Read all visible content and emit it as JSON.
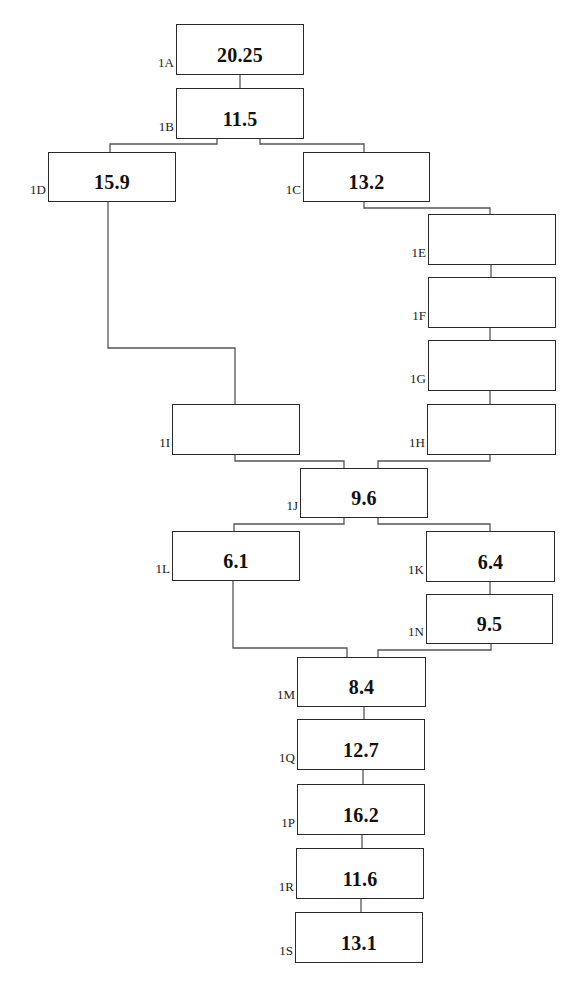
{
  "diagram": {
    "type": "flow-tree",
    "nodes": [
      {
        "id": "1A",
        "label": "1A",
        "value": "20.25",
        "x": 176,
        "y": 24,
        "w": 128,
        "h": 51
      },
      {
        "id": "1B",
        "label": "1B",
        "value": "11.5",
        "x": 176,
        "y": 88,
        "w": 128,
        "h": 51
      },
      {
        "id": "1D",
        "label": "1D",
        "value": "15.9",
        "x": 48,
        "y": 152,
        "w": 128,
        "h": 50
      },
      {
        "id": "1C",
        "label": "1C",
        "value": "13.2",
        "x": 303,
        "y": 152,
        "w": 127,
        "h": 50
      },
      {
        "id": "1E",
        "label": "1E",
        "value": "",
        "x": 428,
        "y": 214,
        "w": 128,
        "h": 51
      },
      {
        "id": "1F",
        "label": "1F",
        "value": "",
        "x": 428,
        "y": 277,
        "w": 128,
        "h": 51
      },
      {
        "id": "1G",
        "label": "1G",
        "value": "",
        "x": 428,
        "y": 340,
        "w": 128,
        "h": 51
      },
      {
        "id": "1I",
        "label": "1I",
        "value": "",
        "x": 172,
        "y": 404,
        "w": 128,
        "h": 51
      },
      {
        "id": "1H",
        "label": "1H",
        "value": "",
        "x": 427,
        "y": 404,
        "w": 129,
        "h": 51
      },
      {
        "id": "1J",
        "label": "1J",
        "value": "9.6",
        "x": 300,
        "y": 468,
        "w": 128,
        "h": 50
      },
      {
        "id": "1L",
        "label": "1L",
        "value": "6.1",
        "x": 172,
        "y": 531,
        "w": 128,
        "h": 50
      },
      {
        "id": "1K",
        "label": "1K",
        "value": "6.4",
        "x": 426,
        "y": 531,
        "w": 129,
        "h": 51
      },
      {
        "id": "1N",
        "label": "1N",
        "value": "9.5",
        "x": 426,
        "y": 594,
        "w": 127,
        "h": 50
      },
      {
        "id": "1M",
        "label": "1M",
        "value": "8.4",
        "x": 297,
        "y": 657,
        "w": 129,
        "h": 50
      },
      {
        "id": "1Q",
        "label": "1Q",
        "value": "12.7",
        "x": 297,
        "y": 719,
        "w": 128,
        "h": 51
      },
      {
        "id": "1P",
        "label": "1P",
        "value": "16.2",
        "x": 297,
        "y": 784,
        "w": 128,
        "h": 51
      },
      {
        "id": "1R",
        "label": "1R",
        "value": "11.6",
        "x": 296,
        "y": 848,
        "w": 128,
        "h": 51
      },
      {
        "id": "1S",
        "label": "1S",
        "value": "13.1",
        "x": 295,
        "y": 912,
        "w": 128,
        "h": 51
      }
    ],
    "edges": [
      {
        "from": "1A",
        "to": "1B"
      },
      {
        "from": "1B",
        "to": "1D"
      },
      {
        "from": "1B",
        "to": "1C"
      },
      {
        "from": "1C",
        "to": "1E"
      },
      {
        "from": "1E",
        "to": "1F"
      },
      {
        "from": "1F",
        "to": "1G"
      },
      {
        "from": "1G",
        "to": "1H"
      },
      {
        "from": "1D",
        "to": "1I"
      },
      {
        "from": "1I",
        "to": "1J"
      },
      {
        "from": "1H",
        "to": "1J"
      },
      {
        "from": "1J",
        "to": "1L"
      },
      {
        "from": "1J",
        "to": "1K"
      },
      {
        "from": "1K",
        "to": "1N"
      },
      {
        "from": "1L",
        "to": "1M"
      },
      {
        "from": "1N",
        "to": "1M"
      },
      {
        "from": "1M",
        "to": "1Q"
      },
      {
        "from": "1Q",
        "to": "1P"
      },
      {
        "from": "1P",
        "to": "1R"
      },
      {
        "from": "1R",
        "to": "1S"
      }
    ]
  }
}
